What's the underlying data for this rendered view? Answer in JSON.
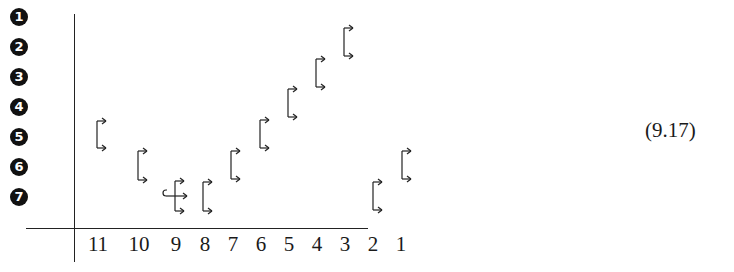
{
  "row_labels": [
    "1",
    "2",
    "3",
    "4",
    "5",
    "6",
    "7"
  ],
  "column_labels": [
    "11",
    "10",
    "9",
    "8",
    "7",
    "6",
    "5",
    "4",
    "3",
    "2",
    "1"
  ],
  "equation_number": "(9.17)",
  "brackets": [
    {
      "column": "11",
      "x": 97,
      "top": 121,
      "bottom": 148
    },
    {
      "column": "10",
      "x": 138,
      "top": 151,
      "bottom": 180
    },
    {
      "column": "9",
      "x": 175,
      "top": 181,
      "bottom": 211,
      "middle_arrow": true,
      "hook": true
    },
    {
      "column": "8",
      "x": 203,
      "top": 182,
      "bottom": 211
    },
    {
      "column": "7",
      "x": 231,
      "top": 151,
      "bottom": 179
    },
    {
      "column": "6",
      "x": 260,
      "top": 120,
      "bottom": 148
    },
    {
      "column": "5",
      "x": 288,
      "top": 89,
      "bottom": 117
    },
    {
      "column": "4",
      "x": 316,
      "top": 59,
      "bottom": 87
    },
    {
      "column": "3",
      "x": 344,
      "top": 28,
      "bottom": 56
    },
    {
      "column": "2",
      "x": 373,
      "top": 182,
      "bottom": 210
    },
    {
      "column": "1",
      "x": 402,
      "top": 151,
      "bottom": 179
    }
  ]
}
